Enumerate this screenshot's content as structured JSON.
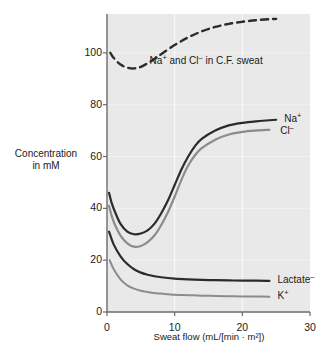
{
  "figure": {
    "y_axis_title_line1": "Concentration",
    "y_axis_title_line2": "in mM",
    "x_axis_title": "Sweat flow (mL/[min · m²])"
  },
  "chart_data": {
    "type": "line",
    "title": "",
    "xlabel": "Sweat flow (mL/[min · m²])",
    "ylabel": "Concentration in mM",
    "xlim": [
      0,
      30
    ],
    "ylim": [
      0,
      115
    ],
    "xticks": [
      0,
      10,
      20,
      30
    ],
    "yticks": [
      0,
      20,
      40,
      60,
      80,
      100
    ],
    "xtick_labels": [
      "0",
      "10",
      "20",
      "30"
    ],
    "ytick_labels": [
      "0",
      "20",
      "40",
      "60",
      "80",
      "100"
    ],
    "grid": true,
    "grid_color": "#f2f2f2",
    "plot_background": "#e9e9e9",
    "legend_position": "inline-right",
    "series": [
      {
        "name": "Na+ and Cl- in C.F. sweat",
        "label": "Na+ and Cl- in C.F. sweat",
        "label_html": "Na<sup>+</sup> and Cl<sup>–</sup> in C.F. sweat",
        "style": "dashed",
        "color": "#2b2b2b",
        "width": 2.4,
        "x": [
          0.5,
          1,
          2,
          3,
          4,
          5,
          6,
          7,
          8,
          10,
          12,
          14,
          16,
          18,
          20,
          22,
          24,
          25
        ],
        "y": [
          100,
          98,
          95.5,
          94.3,
          94.0,
          94.6,
          96,
          97.6,
          99.5,
          103,
          106,
          108.3,
          110,
          111.2,
          112,
          112.6,
          113,
          113.1
        ]
      },
      {
        "name": "Na+",
        "label": "Na+",
        "label_html": "Na<sup>+</sup>",
        "style": "solid",
        "color": "#2b2b2b",
        "width": 2.2,
        "x": [
          0.3,
          0.7,
          1.2,
          2,
          3,
          4,
          5,
          6,
          7,
          8,
          9,
          10,
          11,
          12,
          13,
          14,
          16,
          18,
          20,
          22,
          24,
          25
        ],
        "y": [
          46,
          42,
          38.5,
          34,
          31,
          30,
          30.3,
          31.5,
          34,
          38,
          43,
          49,
          55,
          60,
          64,
          66.8,
          70,
          72,
          73,
          73.6,
          74,
          74.2
        ]
      },
      {
        "name": "Cl-",
        "label": "Cl-",
        "label_html": "Cl<sup>–</sup>",
        "style": "solid",
        "color": "#8c8c8c",
        "width": 2.2,
        "x": [
          0.3,
          0.7,
          1.2,
          2,
          3,
          4,
          5,
          6,
          7,
          8,
          9,
          10,
          11,
          12,
          13,
          14,
          16,
          18,
          20,
          22,
          24
        ],
        "y": [
          41,
          37,
          33.5,
          29.5,
          26.5,
          25.2,
          25.5,
          27,
          29.5,
          33.5,
          38.5,
          44.5,
          51,
          56.5,
          60.5,
          63.2,
          66.5,
          68.5,
          69.5,
          70,
          70.3
        ]
      },
      {
        "name": "Lactate-",
        "label": "Lactate-",
        "label_html": "Lactate<sup>–</sup>",
        "style": "solid",
        "color": "#2b2b2b",
        "width": 2.2,
        "x": [
          0.3,
          1,
          2,
          3,
          4,
          5,
          6,
          7,
          8,
          10,
          12,
          14,
          16,
          18,
          20,
          22,
          24
        ],
        "y": [
          31,
          26,
          21.5,
          18.5,
          16.5,
          15.2,
          14.4,
          13.8,
          13.4,
          12.9,
          12.6,
          12.4,
          12.3,
          12.2,
          12.1,
          12.1,
          12.0
        ]
      },
      {
        "name": "K+",
        "label": "K+",
        "label_html": "K<sup>+</sup>",
        "style": "solid",
        "color": "#8c8c8c",
        "width": 2.0,
        "x": [
          0.4,
          1,
          2,
          3,
          4,
          5,
          6,
          7,
          8,
          10,
          12,
          14,
          16,
          18,
          20,
          22,
          24
        ],
        "y": [
          20,
          16.5,
          12.6,
          10.3,
          9.0,
          8.2,
          7.7,
          7.3,
          7.1,
          6.7,
          6.5,
          6.3,
          6.2,
          6.1,
          6.0,
          6.0,
          5.9
        ]
      }
    ],
    "annotations": [
      {
        "text": "Na+ and Cl- in C.F. sweat",
        "x": 6.0,
        "y": 97
      },
      {
        "text": "Na+",
        "x": 25.6,
        "y": 74.5
      },
      {
        "text": "Cl-",
        "x": 25.0,
        "y": 70.0
      },
      {
        "text": "Lactate-",
        "x": 24.6,
        "y": 12.5
      },
      {
        "text": "K+",
        "x": 24.6,
        "y": 6.3
      }
    ]
  }
}
